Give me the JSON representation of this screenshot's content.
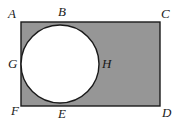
{
  "figure": {
    "background_color": "#ffffff",
    "shaded_fill_color": "#969696",
    "circle_fill_color": "#ffffff",
    "stroke_color": "#1a1a1a",
    "stroke_width": 1.4,
    "rectangle": {
      "name": "ACDF",
      "x": 21,
      "y": 22,
      "width": 139,
      "height": 84
    },
    "circle": {
      "center_x": 60,
      "center_y": 64,
      "radius": 39,
      "tangent_points": [
        "B",
        "G",
        "E"
      ]
    },
    "labels": [
      {
        "id": "A",
        "text": "A",
        "role": "rectangle-top-left-corner"
      },
      {
        "id": "B",
        "text": "B",
        "role": "circle-top-tangent-point"
      },
      {
        "id": "C",
        "text": "C",
        "role": "rectangle-top-right-corner"
      },
      {
        "id": "D",
        "text": "D",
        "role": "rectangle-bottom-right-corner"
      },
      {
        "id": "E",
        "text": "E",
        "role": "circle-bottom-tangent-point"
      },
      {
        "id": "F",
        "text": "F",
        "role": "rectangle-bottom-left-corner"
      },
      {
        "id": "G",
        "text": "G",
        "role": "circle-left-tangent-point"
      },
      {
        "id": "H",
        "text": "H",
        "role": "circle-right-extreme-point"
      }
    ]
  }
}
